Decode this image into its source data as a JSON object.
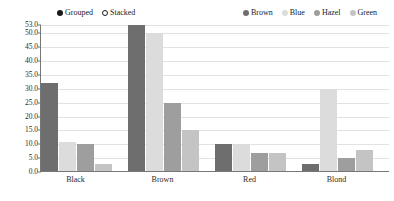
{
  "chart_data": {
    "type": "bar",
    "title": "",
    "xlabel": "",
    "ylabel": "",
    "categories": [
      "Black",
      "Brown",
      "Red",
      "Blond"
    ],
    "series": [
      {
        "name": "Brown",
        "color": "#6e6e6e",
        "values": [
          32,
          53,
          10,
          3
        ]
      },
      {
        "name": "Blue",
        "color": "#dcdcdc",
        "values": [
          11,
          50,
          10,
          30
        ]
      },
      {
        "name": "Hazel",
        "color": "#9e9e9e",
        "values": [
          10,
          25,
          7,
          5
        ]
      },
      {
        "name": "Green",
        "color": "#c4c4c4",
        "values": [
          3,
          15,
          7,
          8
        ]
      }
    ],
    "ylim": [
      0,
      53
    ],
    "yticks": [
      "0.0",
      "5.0",
      "10.0",
      "15.0",
      "20.0",
      "25.0",
      "30.0",
      "35.0",
      "40.0",
      "45.0",
      "50.0",
      "53.0"
    ],
    "ytick_values": [
      0,
      5,
      10,
      15,
      20,
      25,
      30,
      35,
      40,
      45,
      50,
      53
    ],
    "grid": true,
    "legend_position": "top"
  },
  "legends": {
    "style": {
      "items": [
        {
          "label": "Grouped",
          "marker": "filled-circle"
        },
        {
          "label": "Stacked",
          "marker": "hollow-circle"
        }
      ]
    },
    "color": {
      "items": [
        {
          "label": "Brown",
          "marker": "square",
          "color": "#6e6e6e"
        },
        {
          "label": "Blue",
          "marker": "square",
          "color": "#dcdcdc"
        },
        {
          "label": "Hazel",
          "marker": "square",
          "color": "#9e9e9e"
        },
        {
          "label": "Green",
          "marker": "square",
          "color": "#c4c4c4"
        }
      ]
    }
  }
}
